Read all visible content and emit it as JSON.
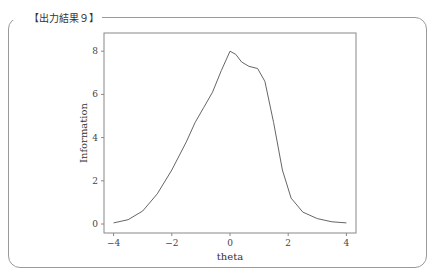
{
  "box_title": "【出力結果９】",
  "chart_data": {
    "type": "line",
    "title": "",
    "xlabel": "theta",
    "ylabel": "Information",
    "xlim": [
      -4.3,
      4.3
    ],
    "ylim": [
      -0.4,
      8.6
    ],
    "xticks": [
      -4,
      -2,
      0,
      2,
      4
    ],
    "yticks": [
      0,
      2,
      4,
      6,
      8
    ],
    "grid": false,
    "legend": null,
    "series": [
      {
        "name": "Information",
        "x": [
          -4.0,
          -3.5,
          -3.0,
          -2.5,
          -2.0,
          -1.5,
          -1.2,
          -0.9,
          -0.6,
          -0.3,
          0.0,
          0.2,
          0.4,
          0.65,
          0.95,
          1.2,
          1.5,
          1.8,
          2.1,
          2.5,
          3.0,
          3.5,
          4.0
        ],
        "y": [
          0.05,
          0.2,
          0.6,
          1.4,
          2.5,
          3.8,
          4.7,
          5.4,
          6.1,
          7.1,
          8.0,
          7.85,
          7.5,
          7.3,
          7.2,
          6.6,
          4.7,
          2.5,
          1.2,
          0.55,
          0.25,
          0.1,
          0.05
        ]
      }
    ]
  }
}
